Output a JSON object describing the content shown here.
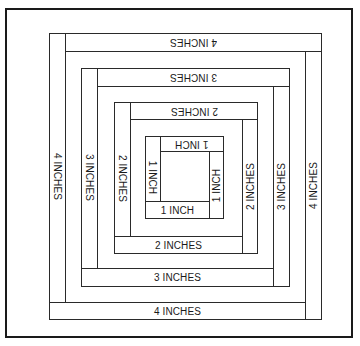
{
  "diagram": {
    "title": "",
    "rings": [
      {
        "id": 1,
        "top_label": "1 INCH",
        "left_label": "1 INCH",
        "right_label": "1 INCH",
        "bottom_label": "1 INCH"
      },
      {
        "id": 2,
        "top_label": "2 INCHES",
        "left_label": "2 INCHES",
        "right_label": "2 INCHES",
        "bottom_label": "2 INCHES"
      },
      {
        "id": 3,
        "top_label": "3 INCHES",
        "left_label": "3 INCHES",
        "right_label": "3 INCHES",
        "bottom_label": "3 INCHES"
      },
      {
        "id": 4,
        "top_label": "4 INCHES",
        "left_label": "4 INCHES",
        "right_label": "4 INCHES",
        "bottom_label": "4 INCHES"
      }
    ],
    "colors": {
      "line": "#1a1a1a",
      "background": "#ffffff"
    }
  }
}
